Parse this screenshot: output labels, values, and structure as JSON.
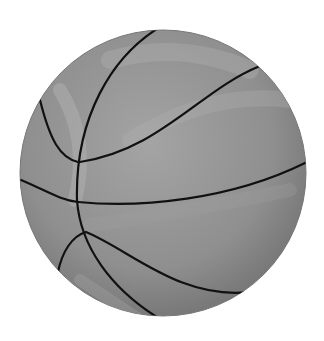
{
  "image": {
    "subject": "basketball",
    "style": "grayscale illustration",
    "colors": {
      "background": "#ffffff",
      "ball_light": "#a8a8a8",
      "ball_mid": "#8e8e8e",
      "ball_dark": "#6f6f6f",
      "seam": "#111111"
    }
  }
}
